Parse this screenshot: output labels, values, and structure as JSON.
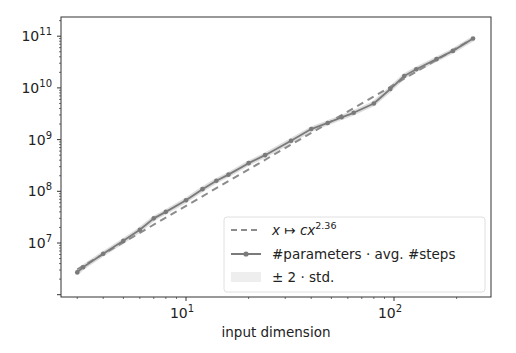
{
  "chart_data": {
    "type": "line",
    "title": "",
    "xlabel": "input dimension",
    "ylabel": "",
    "xscale": "log",
    "yscale": "log",
    "xlim": [
      2.5,
      320
    ],
    "ylim": [
      1200000.0,
      200000000000.0
    ],
    "grid": false,
    "legend_position": "lower right",
    "x_ticks": [
      {
        "value": 10,
        "base": "10",
        "exp": "1"
      },
      {
        "value": 100,
        "base": "10",
        "exp": "2"
      }
    ],
    "y_ticks": [
      {
        "value": 10000000.0,
        "base": "10",
        "exp": "7"
      },
      {
        "value": 100000000.0,
        "base": "10",
        "exp": "8"
      },
      {
        "value": 1000000000.0,
        "base": "10",
        "exp": "9"
      },
      {
        "value": 10000000000.0,
        "base": "10",
        "exp": "10"
      },
      {
        "value": 100000000000.0,
        "base": "10",
        "exp": "11"
      }
    ],
    "series": [
      {
        "name": "x ↦ cx^2.36",
        "style": "dashed",
        "color": "#8c8c8c",
        "x": [
          3,
          240
        ],
        "y": [
          3100000.0,
          90000000000.0
        ]
      },
      {
        "name": "#parameters · avg. #steps",
        "style": "solid-marker",
        "color": "#7a7a7a",
        "x": [
          3,
          3.2,
          4,
          5,
          6,
          7,
          8,
          10,
          12,
          14,
          16,
          20,
          24,
          32,
          40,
          48,
          56,
          64,
          80,
          96,
          112,
          128,
          160,
          192,
          240
        ],
        "y": [
          2700000.0,
          3400000.0,
          6200000.0,
          11000000.0,
          18000000.0,
          30000000.0,
          40000000.0,
          67000000.0,
          110000000.0,
          160000000.0,
          210000000.0,
          350000000.0,
          500000000.0,
          950000000.0,
          1600000000.0,
          2100000000.0,
          2700000000.0,
          3300000000.0,
          5000000000.0,
          9500000000.0,
          17000000000.0,
          23000000000.0,
          36000000000.0,
          52000000000.0,
          90000000000.0
        ]
      },
      {
        "name": "± 2 · std.",
        "style": "band",
        "color": "#d9d9d9",
        "note": "band very narrow, nearly invisible around solid line"
      }
    ]
  },
  "legend": {
    "items": [
      {
        "kind": "dashed",
        "label_pre": "x ↦ cx",
        "label_sup": "2.36"
      },
      {
        "kind": "marker-line",
        "label": "#parameters · avg. #steps"
      },
      {
        "kind": "band",
        "label": "± 2 · std."
      }
    ]
  },
  "colors": {
    "axes": "#333333",
    "line": "#7a7a7a",
    "dashed": "#8c8c8c",
    "band": "#e6e6e6",
    "legend_border": "#e0e0e0"
  }
}
